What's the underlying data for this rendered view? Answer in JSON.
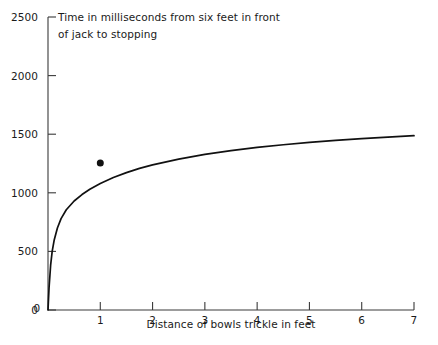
{
  "chart_data": {
    "type": "line",
    "title": "Time in milliseconds from six feet in front of jack to stopping",
    "title_lines": [
      "Time in milliseconds from six feet in front",
      "of jack to stopping"
    ],
    "xlabel": "Distance of bowls trickle in feet",
    "ylabel": "",
    "xlim": [
      0,
      7
    ],
    "ylim": [
      0,
      2500
    ],
    "xticks": [
      0,
      1,
      2,
      3,
      4,
      5,
      6,
      7
    ],
    "xtick_labels": [
      "0",
      "1",
      "2",
      "3",
      "4",
      "5",
      "6",
      "7"
    ],
    "yticks": [
      0,
      500,
      1000,
      1500,
      2000,
      2500
    ],
    "ytick_labels": [
      "0",
      "500",
      "1000",
      "1500",
      "2000",
      "2500"
    ],
    "grid": false,
    "legend": null,
    "series": [
      {
        "name": "fitted-curve",
        "type": "line",
        "color": "#111111",
        "linewidth": 1.7,
        "x": [
          0,
          0.02,
          0.05,
          0.08,
          0.12,
          0.18,
          0.25,
          0.35,
          0.5,
          0.65,
          0.8,
          1.0,
          1.25,
          1.5,
          1.75,
          2.0,
          2.5,
          3.0,
          3.5,
          4.0,
          4.5,
          5.0,
          5.5,
          6.0,
          6.5,
          7.0
        ],
        "y": [
          0,
          190,
          380,
          500,
          600,
          700,
          780,
          855,
          930,
          985,
          1030,
          1080,
          1130,
          1172,
          1208,
          1238,
          1288,
          1328,
          1360,
          1387,
          1410,
          1430,
          1447,
          1462,
          1475,
          1487
        ]
      },
      {
        "name": "observed-point",
        "type": "scatter",
        "color": "#111111",
        "marker": "circle",
        "marker_size": 7,
        "points": [
          {
            "x": 1,
            "y": 1255
          }
        ]
      }
    ]
  },
  "axes": {
    "x_axis_name": "x-axis",
    "y_axis_name": "y-axis"
  }
}
